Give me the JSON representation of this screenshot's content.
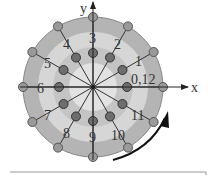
{
  "diagram": {
    "axes": {
      "x_label": "x",
      "y_label": "y"
    },
    "center": [
      93,
      87
    ],
    "outer_radius": 70,
    "inner_radius": 34,
    "spokes": 12,
    "labels": [
      {
        "text": "0,12",
        "x": 131,
        "y": 84
      },
      {
        "text": "1",
        "x": 135,
        "y": 66
      },
      {
        "text": "2",
        "x": 114,
        "y": 49
      },
      {
        "text": "3",
        "x": 89,
        "y": 43
      },
      {
        "text": "4",
        "x": 63,
        "y": 49
      },
      {
        "text": "5",
        "x": 44,
        "y": 68
      },
      {
        "text": "6",
        "x": 37,
        "y": 93
      },
      {
        "text": "7",
        "x": 44,
        "y": 120
      },
      {
        "text": "8",
        "x": 63,
        "y": 138
      },
      {
        "text": "9",
        "x": 89,
        "y": 142
      },
      {
        "text": "10",
        "x": 111,
        "y": 140
      },
      {
        "text": "11",
        "x": 131,
        "y": 120
      }
    ],
    "colors": {
      "outer_band": "#b4b4b4",
      "middle_band": "#d8d8d8",
      "inner_band": "#c4c4c4",
      "center": "#e4e4e4",
      "dot_outer": "#9a9a9a",
      "dot_inner": "#6e6e6e",
      "line": "#333333"
    }
  }
}
